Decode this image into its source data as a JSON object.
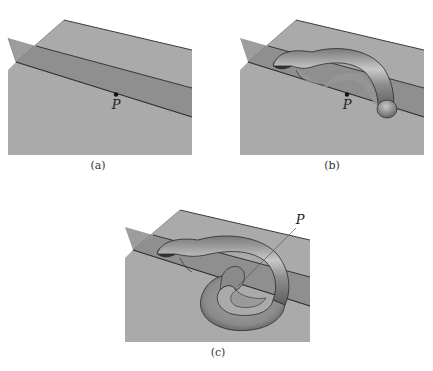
{
  "figure": {
    "panels": [
      {
        "id": "a",
        "caption": "(a)",
        "point_label": "P",
        "description": "Two intersecting planes: a horizontal plane and an oblique vertical plane meeting along a line through point P"
      },
      {
        "id": "b",
        "caption": "(b)",
        "point_label": "P",
        "description": "A half-torus tube arching from the vertical plane over point P and terminating in a rounded cap"
      },
      {
        "id": "c",
        "caption": "(c)",
        "point_label": "P",
        "description": "The tube continues and loops around, forming a torus-like coil; a leader line points from label P to the center of the loop"
      }
    ],
    "colors": {
      "plane": "#a9a9a9",
      "plane_dark": "#8e8e8e",
      "vertical_plane": "#9a9a9a",
      "edge": "#2a2a2a",
      "tube": "#8c8c8c",
      "tube_highlight": "#c4c4c4",
      "tube_shadow": "#3a3a3a",
      "background": "#ffffff"
    }
  }
}
